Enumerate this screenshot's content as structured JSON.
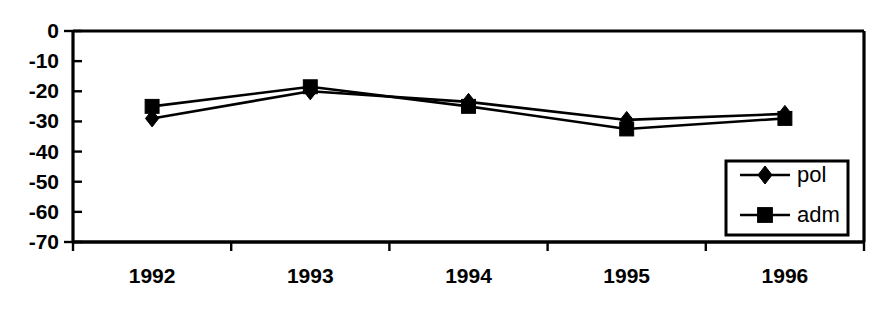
{
  "chart_data": {
    "type": "line",
    "title": "",
    "subtitle": "",
    "xlabel": "",
    "ylabel": "",
    "categories": [
      "1992",
      "1993",
      "1994",
      "1995",
      "1996"
    ],
    "series": [
      {
        "name": "pol",
        "marker": "diamond",
        "values": [
          -29,
          -20,
          -23.5,
          -29.5,
          -27.5
        ]
      },
      {
        "name": "adm",
        "marker": "square",
        "values": [
          -25,
          -18.5,
          -25,
          -32.5,
          -29
        ]
      }
    ],
    "ylim": [
      -70,
      0
    ],
    "ytick_values": [
      0,
      -10,
      -20,
      -30,
      -40,
      -50,
      -60,
      -70
    ],
    "ytick_labels": [
      "0",
      "-10",
      "-20",
      "-30",
      "-40",
      "-50",
      "-60",
      "-70"
    ],
    "xtick_labels": [
      "1992",
      "1993",
      "1994",
      "1995",
      "1996"
    ],
    "grid": false,
    "legend_position": "bottom-right",
    "legend_entries": [
      {
        "label": "pol",
        "marker": "diamond"
      },
      {
        "label": "adm",
        "marker": "square"
      }
    ],
    "colors": {
      "series_pol": "#000000",
      "series_adm": "#000000",
      "axis": "#000000",
      "background": "#ffffff"
    }
  }
}
